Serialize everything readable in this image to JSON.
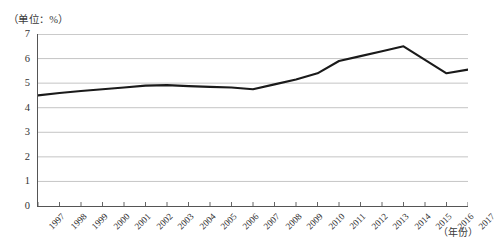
{
  "chart_data": {
    "type": "line",
    "title": "",
    "subtitle": "",
    "unit_caption": "（单位：%）",
    "xlabel": "（年份）",
    "ylabel": "",
    "grid": true,
    "legend": "none",
    "xlim": [
      1997,
      2017
    ],
    "ylim": [
      0,
      7
    ],
    "ytick_step": 1,
    "yticks": [
      "7",
      "6",
      "5",
      "4",
      "3",
      "2",
      "1",
      "0"
    ],
    "categories": [
      "1997",
      "1998",
      "1999",
      "2000",
      "2001",
      "2002",
      "2003",
      "2004",
      "2005",
      "2006",
      "2007",
      "2008",
      "2009",
      "2010",
      "2011",
      "2012",
      "2013",
      "2014",
      "2015",
      "2016",
      "2017"
    ],
    "series": [
      {
        "name": "",
        "color": "#1a1a1a",
        "values": [
          4.5,
          4.6,
          4.68,
          4.75,
          4.82,
          4.9,
          4.92,
          4.88,
          4.85,
          4.82,
          4.75,
          4.95,
          5.15,
          5.4,
          5.9,
          6.1,
          6.3,
          6.5,
          5.95,
          5.4,
          5.55
        ]
      }
    ]
  },
  "style": {
    "line_color": "#1a1a1a",
    "grid_color": "#b9b9b9",
    "axis_color": "#555555",
    "background": "#ffffff"
  }
}
